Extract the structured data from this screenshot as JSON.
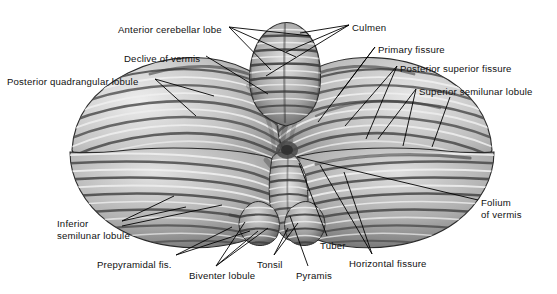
{
  "figure": {
    "style": "grayscale anatomical engraving",
    "width": 557,
    "height": 294,
    "background_color": "#ffffff",
    "line_color": "#000000",
    "text_color": "#111111"
  },
  "palette": {
    "ink": "#000000",
    "paper": "#ffffff",
    "folia_light": "#f2f2f2",
    "folia_mid": "#b9b9b9",
    "folia_dark": "#585858",
    "folia_deep": "#383838",
    "outline": "#2b2b2b"
  },
  "labels": [
    {
      "id": "anterior-cerebellar-lobe",
      "text": "Anterior cerebellar lobe",
      "x": 118,
      "y": 24,
      "align": "left"
    },
    {
      "id": "culmen",
      "text": "Culmen",
      "x": 352,
      "y": 22,
      "align": "left"
    },
    {
      "id": "declive-of-vermis",
      "text": "Declive of vermis",
      "x": 124,
      "y": 53,
      "align": "left"
    },
    {
      "id": "primary-fissure",
      "text": "Primary fissure",
      "x": 378,
      "y": 44,
      "align": "left"
    },
    {
      "id": "posterior-superior-fissure",
      "text": "Posterior superior fissure",
      "x": 400,
      "y": 63,
      "align": "left"
    },
    {
      "id": "posterior-quadrangular-lobule",
      "text": "Posterior quadrangular lobule",
      "x": 7,
      "y": 76,
      "align": "left"
    },
    {
      "id": "superior-semilunar-lobule",
      "text": "Superior semilunar lobule",
      "x": 419,
      "y": 86,
      "align": "left"
    },
    {
      "id": "folium-of-vermis",
      "text": "Folium\nof vermis",
      "x": 481,
      "y": 197,
      "align": "left"
    },
    {
      "id": "inferior-semilunar-lobule",
      "text": "Inferior\nsemilunar lobule",
      "x": 57,
      "y": 218,
      "align": "left"
    },
    {
      "id": "prepyramidal-fis",
      "text": "Prepyramidal fis.",
      "x": 97,
      "y": 259,
      "align": "left"
    },
    {
      "id": "biventer-lobule",
      "text": "Biventer lobule",
      "x": 189,
      "y": 270,
      "align": "left"
    },
    {
      "id": "tonsil",
      "text": "Tonsil",
      "x": 257,
      "y": 259,
      "align": "left"
    },
    {
      "id": "tuber",
      "text": "Tuber",
      "x": 320,
      "y": 240,
      "align": "left"
    },
    {
      "id": "pyramis",
      "text": "Pyramis",
      "x": 296,
      "y": 270,
      "align": "left"
    },
    {
      "id": "horizontal-fissure",
      "text": "Horizontal fissure",
      "x": 349,
      "y": 258,
      "align": "left"
    }
  ],
  "leader_lines": [
    {
      "label": "anterior-cerebellar-lobe",
      "from": [
        229,
        27
      ],
      "to": [
        311,
        36
      ]
    },
    {
      "label": "anterior-cerebellar-lobe",
      "from": [
        229,
        27
      ],
      "to": [
        296,
        57
      ]
    },
    {
      "label": "anterior-cerebellar-lobe",
      "from": [
        229,
        27
      ],
      "to": [
        271,
        70
      ]
    },
    {
      "label": "culmen",
      "from": [
        349,
        25
      ],
      "to": [
        300,
        33
      ]
    },
    {
      "label": "culmen",
      "from": [
        349,
        25
      ],
      "to": [
        286,
        52
      ]
    },
    {
      "label": "culmen",
      "from": [
        349,
        25
      ],
      "to": [
        266,
        76
      ]
    },
    {
      "label": "declive-of-vermis",
      "from": [
        206,
        56
      ],
      "to": [
        268,
        94
      ]
    },
    {
      "label": "primary-fissure",
      "from": [
        375,
        47
      ],
      "to": [
        338,
        96
      ]
    },
    {
      "label": "primary-fissure",
      "from": [
        375,
        47
      ],
      "to": [
        318,
        122
      ]
    },
    {
      "label": "posterior-superior-fissure",
      "from": [
        397,
        66
      ],
      "to": [
        345,
        126
      ]
    },
    {
      "label": "posterior-superior-fissure",
      "from": [
        397,
        66
      ],
      "to": [
        366,
        139
      ]
    },
    {
      "label": "posterior-quadrangular-lobule",
      "from": [
        155,
        79
      ],
      "to": [
        214,
        96
      ]
    },
    {
      "label": "posterior-quadrangular-lobule",
      "from": [
        155,
        79
      ],
      "to": [
        196,
        116
      ]
    },
    {
      "label": "superior-semilunar-lobule",
      "from": [
        416,
        89
      ],
      "to": [
        378,
        139
      ]
    },
    {
      "label": "superior-semilunar-lobule",
      "from": [
        416,
        89
      ],
      "to": [
        403,
        146
      ]
    },
    {
      "label": "superior-semilunar-lobule",
      "from": [
        450,
        97
      ],
      "to": [
        432,
        147
      ]
    },
    {
      "label": "folium-of-vermis",
      "from": [
        478,
        200
      ],
      "to": [
        297,
        157
      ]
    },
    {
      "label": "inferior-semilunar-lobule",
      "from": [
        122,
        221
      ],
      "to": [
        174,
        196
      ]
    },
    {
      "label": "inferior-semilunar-lobule",
      "from": [
        122,
        221
      ],
      "to": [
        186,
        207
      ]
    },
    {
      "label": "inferior-semilunar-lobule",
      "from": [
        122,
        226
      ],
      "to": [
        222,
        205
      ]
    },
    {
      "label": "prepyramidal-fis",
      "from": [
        176,
        255
      ],
      "to": [
        232,
        227
      ]
    },
    {
      "label": "prepyramidal-fis",
      "from": [
        176,
        255
      ],
      "to": [
        250,
        231
      ]
    },
    {
      "label": "biventer-lobule",
      "from": [
        216,
        266
      ],
      "to": [
        245,
        222
      ]
    },
    {
      "label": "biventer-lobule",
      "from": [
        216,
        266
      ],
      "to": [
        258,
        231
      ]
    },
    {
      "label": "biventer-lobule",
      "from": [
        216,
        266
      ],
      "to": [
        268,
        228
      ]
    },
    {
      "label": "tonsil",
      "from": [
        274,
        255
      ],
      "to": [
        298,
        223
      ]
    },
    {
      "label": "tonsil",
      "from": [
        274,
        255
      ],
      "to": [
        288,
        228
      ]
    },
    {
      "label": "tuber",
      "from": [
        327,
        236
      ],
      "to": [
        299,
        163
      ]
    },
    {
      "label": "pyramis",
      "from": [
        308,
        266
      ],
      "to": [
        290,
        216
      ]
    },
    {
      "label": "horizontal-fissure",
      "from": [
        372,
        254
      ],
      "to": [
        320,
        165
      ]
    },
    {
      "label": "horizontal-fissure",
      "from": [
        372,
        254
      ],
      "to": [
        344,
        172
      ]
    }
  ],
  "anatomy_regions": [
    {
      "name": "left-posterior-quadrangular-lobule",
      "side": "left",
      "aspect": "superior"
    },
    {
      "name": "left-superior-semilunar-lobule",
      "side": "left",
      "aspect": "superior"
    },
    {
      "name": "left-inferior-semilunar-lobule",
      "side": "left",
      "aspect": "inferior"
    },
    {
      "name": "left-biventer-lobule",
      "side": "left",
      "aspect": "inferior"
    },
    {
      "name": "right-posterior-quadrangular-lobule",
      "side": "right",
      "aspect": "superior"
    },
    {
      "name": "right-superior-semilunar-lobule",
      "side": "right",
      "aspect": "superior"
    },
    {
      "name": "right-inferior-semilunar-lobule",
      "side": "right",
      "aspect": "inferior"
    },
    {
      "name": "vermis-culmen",
      "side": "midline",
      "aspect": "superior"
    },
    {
      "name": "vermis-declive",
      "side": "midline",
      "aspect": "superior"
    },
    {
      "name": "vermis-folium",
      "side": "midline",
      "aspect": "posterior"
    },
    {
      "name": "vermis-tuber",
      "side": "midline",
      "aspect": "inferior"
    },
    {
      "name": "vermis-pyramis",
      "side": "midline",
      "aspect": "inferior"
    },
    {
      "name": "tonsil-left",
      "side": "left",
      "aspect": "inferior"
    },
    {
      "name": "tonsil-right",
      "side": "right",
      "aspect": "inferior"
    }
  ]
}
